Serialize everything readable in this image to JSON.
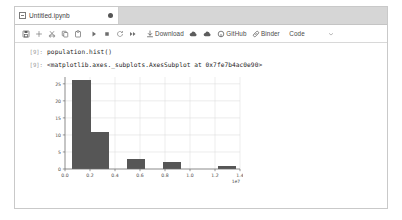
{
  "window": {
    "tab": {
      "title": "Untitled.ipynb",
      "icon": "notebook-icon",
      "dirty_indicator": "●"
    }
  },
  "toolbar": {
    "items": [
      {
        "name": "save-button",
        "icon": "save-icon",
        "label": ""
      },
      {
        "name": "insert-button",
        "icon": "plus-icon",
        "label": ""
      },
      {
        "name": "cut-button",
        "icon": "scissors-icon",
        "label": ""
      },
      {
        "name": "copy-button",
        "icon": "copy-icon",
        "label": ""
      },
      {
        "name": "paste-button",
        "icon": "paste-icon",
        "label": ""
      },
      {
        "name": "run-button",
        "icon": "play-icon",
        "label": ""
      },
      {
        "name": "stop-button",
        "icon": "stop-icon",
        "label": ""
      },
      {
        "name": "restart-button",
        "icon": "restart-icon",
        "label": ""
      },
      {
        "name": "restart-run-all-button",
        "icon": "fast-forward-icon",
        "label": ""
      },
      {
        "name": "download-button",
        "icon": "download-icon",
        "label": "Download"
      },
      {
        "name": "copy-to-drive-button",
        "icon": "cloud-icon",
        "label": ""
      },
      {
        "name": "save-to-drive-button",
        "icon": "cloud-icon",
        "label": ""
      },
      {
        "name": "github-button",
        "icon": "github-icon",
        "label": "GitHub"
      },
      {
        "name": "binder-button",
        "icon": "link-icon",
        "label": "Binder"
      }
    ],
    "celltype": {
      "value": "Code",
      "chevron": "chevron-down-icon"
    }
  },
  "notebook": {
    "cells": [
      {
        "type": "input",
        "prompt": "[9]:",
        "source": "population.hist()"
      },
      {
        "type": "output-text",
        "prompt": "[9]:",
        "text": "<matplotlib.axes._subplots.AxesSubplot at 0x7fe7b4ac0e90>"
      }
    ]
  },
  "chart_data": {
    "type": "bar",
    "title": "",
    "xlabel": "",
    "ylabel": "",
    "bar_color": "#565656",
    "grid": true,
    "legend": null,
    "x_offset_text": "1e7",
    "xlim": [
      0.0,
      1.4
    ],
    "ylim": [
      0,
      27
    ],
    "xticks": [
      "0.0",
      "0.2",
      "0.4",
      "0.6",
      "0.8",
      "1.0",
      "1.2",
      "1.4"
    ],
    "xtick_values": [
      0.0,
      0.2,
      0.4,
      0.6,
      0.8,
      1.0,
      1.2,
      1.4
    ],
    "yticks": [
      "0",
      "5",
      "10",
      "15",
      "20",
      "25"
    ],
    "ytick_values": [
      0,
      5,
      10,
      15,
      20,
      25
    ],
    "bins": [
      {
        "x0": 0.055,
        "x1": 0.205,
        "value": 26
      },
      {
        "x0": 0.205,
        "x1": 0.35,
        "value": 11
      },
      {
        "x0": 0.35,
        "x1": 0.495,
        "value": 0
      },
      {
        "x0": 0.495,
        "x1": 0.64,
        "value": 3
      },
      {
        "x0": 0.64,
        "x1": 0.785,
        "value": 0
      },
      {
        "x0": 0.785,
        "x1": 0.93,
        "value": 2
      },
      {
        "x0": 0.93,
        "x1": 1.075,
        "value": 0
      },
      {
        "x0": 1.075,
        "x1": 1.22,
        "value": 0
      },
      {
        "x0": 1.22,
        "x1": 1.365,
        "value": 1
      }
    ]
  }
}
